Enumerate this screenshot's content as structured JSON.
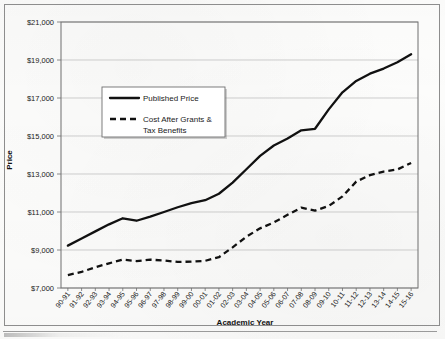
{
  "chart_data": {
    "type": "line",
    "title": "",
    "xlabel": "Academic Year",
    "ylabel": "Price",
    "ylim": [
      7000,
      21000
    ],
    "ytick_step": 2000,
    "grid": true,
    "legend_position": "upper-left-inside",
    "ytick_labels": [
      "$7,000",
      "$9,000",
      "$11,000",
      "$13,000",
      "$15,000",
      "$17,000",
      "$19,000",
      "$21,000"
    ],
    "ytick_values": [
      7000,
      9000,
      11000,
      13000,
      15000,
      17000,
      19000,
      21000
    ],
    "categories": [
      "90-91",
      "91-92",
      "92-93",
      "93-94",
      "94-95",
      "95-96",
      "96-97",
      "97-98",
      "98-99",
      "99-00",
      "00-01",
      "01-02",
      "02-03",
      "03-04",
      "04-05",
      "05-06",
      "06-07",
      "07-08",
      "08-09",
      "09-10",
      "10-11",
      "11-12",
      "12-13",
      "13-14",
      "14-15",
      "15-16"
    ],
    "series": [
      {
        "name": "Published Price",
        "style": "solid",
        "color": "#111111",
        "values": [
          9230,
          9600,
          9980,
          10350,
          10670,
          10540,
          10760,
          11000,
          11250,
          11470,
          11620,
          11960,
          12550,
          13250,
          13950,
          14500,
          14870,
          15300,
          15380,
          16400,
          17300,
          17900,
          18280,
          18550,
          18880,
          19300
        ]
      },
      {
        "name": "Cost After Grants & Tax Benefits",
        "style": "dashed",
        "color": "#111111",
        "values": [
          7680,
          7850,
          8090,
          8300,
          8490,
          8420,
          8490,
          8450,
          8370,
          8390,
          8430,
          8620,
          9140,
          9700,
          10140,
          10450,
          10850,
          11230,
          11070,
          11320,
          11820,
          12600,
          12940,
          13130,
          13240,
          13580
        ]
      }
    ],
    "legend": [
      {
        "label": "Published Price",
        "style": "solid"
      },
      {
        "label": "Cost After Grants &",
        "label2": "Tax Benefits",
        "style": "dashed"
      }
    ]
  },
  "colors": {
    "ink": "#111111",
    "grid": "#b9b9b9",
    "frame": "#8d8d8d",
    "paper": "#fdfdfc"
  }
}
